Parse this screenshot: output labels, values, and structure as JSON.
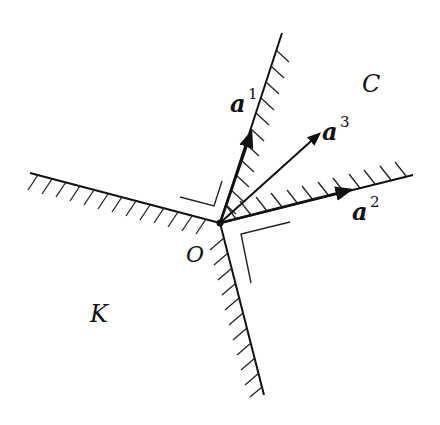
{
  "diagram": {
    "type": "cone-polar-illustration",
    "origin": {
      "label": "O",
      "x": 220,
      "y": 223
    },
    "regions": {
      "C": {
        "label": "C",
        "x": 372,
        "y": 92
      },
      "K": {
        "label": "K",
        "x": 102,
        "y": 317
      }
    },
    "vectors": [
      {
        "name": "a1",
        "base": "a",
        "sup": "1",
        "tip_x": 251,
        "tip_y": 133,
        "label_x": 228,
        "label_y": 109
      },
      {
        "name": "a2",
        "base": "a",
        "sup": "2",
        "tip_x": 350,
        "tip_y": 190,
        "label_x": 354,
        "label_y": 218
      },
      {
        "name": "a3",
        "base": "a",
        "sup": "3",
        "tip_x": 319,
        "tip_y": 134,
        "label_x": 322,
        "label_y": 137
      }
    ],
    "boundaries": {
      "C_ray_1_end": {
        "x": 282,
        "y": 33
      },
      "C_ray_2_end": {
        "x": 413,
        "y": 175
      },
      "K_ray_left_end": {
        "x": 30,
        "y": 173
      },
      "K_ray_bottom_end": {
        "x": 264,
        "y": 395
      }
    },
    "colors": {
      "ink": "#111111",
      "background": "#ffffff"
    }
  }
}
